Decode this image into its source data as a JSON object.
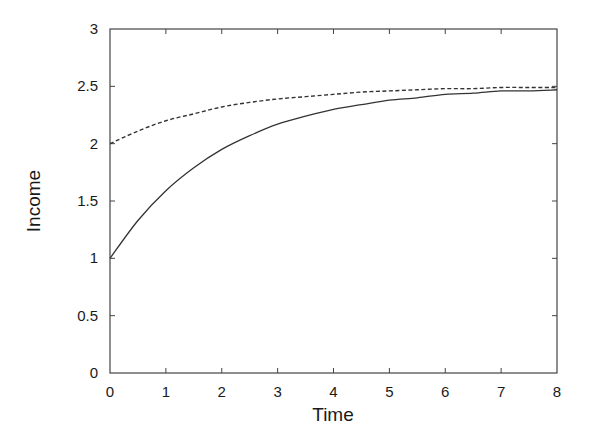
{
  "chart_data": {
    "type": "line",
    "title": "",
    "xlabel": "Time",
    "ylabel": "Income",
    "xlim": [
      0,
      8
    ],
    "ylim": [
      0,
      3
    ],
    "grid": false,
    "legend": null,
    "x_ticks": [
      "0",
      "1",
      "2",
      "3",
      "4",
      "5",
      "6",
      "7",
      "8"
    ],
    "y_ticks": [
      "0",
      "0.5",
      "1",
      "1.5",
      "2",
      "2.5",
      "3"
    ],
    "x": [
      0,
      0.5,
      1,
      1.5,
      2,
      2.5,
      3,
      3.5,
      4,
      4.5,
      5,
      5.5,
      6,
      6.5,
      7,
      7.5,
      8
    ],
    "series": [
      {
        "name": "solid",
        "style": "solid",
        "color": "#333333",
        "values": [
          1.0,
          1.33,
          1.59,
          1.79,
          1.95,
          2.07,
          2.17,
          2.24,
          2.3,
          2.34,
          2.38,
          2.4,
          2.43,
          2.44,
          2.46,
          2.46,
          2.47
        ]
      },
      {
        "name": "dashed",
        "style": "dashed",
        "color": "#333333",
        "values": [
          2.0,
          2.11,
          2.2,
          2.26,
          2.32,
          2.36,
          2.39,
          2.41,
          2.43,
          2.45,
          2.46,
          2.47,
          2.48,
          2.48,
          2.49,
          2.49,
          2.49
        ]
      }
    ]
  }
}
